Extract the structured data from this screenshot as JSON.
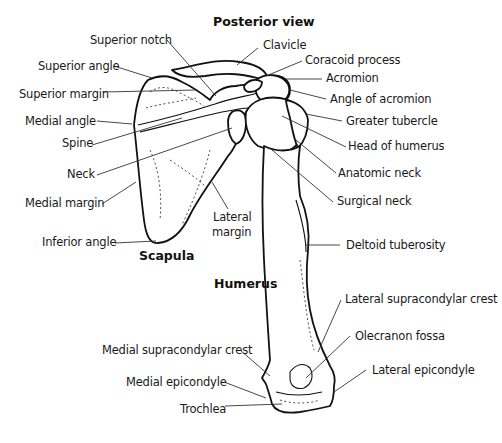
{
  "figure": {
    "title": "Posterior view",
    "scapula_heading": "Scapula",
    "humerus_heading": "Humerus"
  },
  "labels": {
    "superior_notch": "Superior notch",
    "superior_angle": "Superior angle",
    "superior_margin": "Superior margin",
    "medial_angle": "Medial angle",
    "spine": "Spine",
    "neck": "Neck",
    "medial_margin": "Medial margin",
    "inferior_angle": "Inferior angle",
    "lateral_margin_line1": "Lateral",
    "lateral_margin_line2": "margin",
    "clavicle": "Clavicle",
    "coracoid_process": "Coracoid process",
    "acromion": "Acromion",
    "angle_of_acromion": "Angle of acromion",
    "greater_tubercle": "Greater tubercle",
    "head_of_humerus": "Head of humerus",
    "anatomic_neck": "Anatomic neck",
    "surgical_neck": "Surgical neck",
    "deltoid_tuberosity": "Deltoid tuberosity",
    "lateral_supracondylar_crest": "Lateral supracondylar crest",
    "olecranon_fossa": "Olecranon fossa",
    "medial_supracondylar_crest": "Medial supracondylar crest",
    "medial_epicondyle": "Medial epicondyle",
    "lateral_epicondyle": "Lateral epicondyle",
    "trochlea": "Trochlea"
  }
}
